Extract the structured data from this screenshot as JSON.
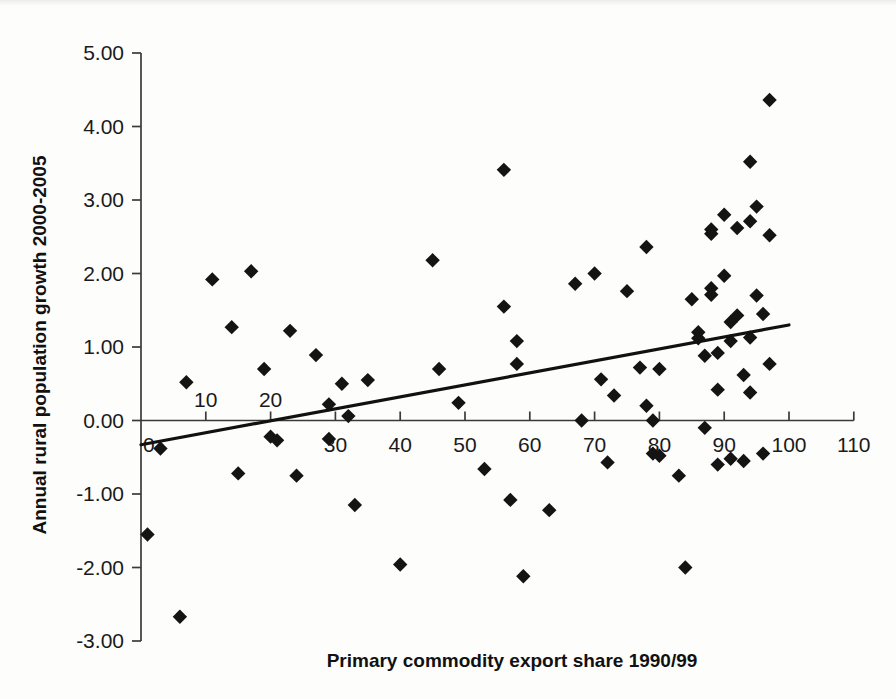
{
  "chart_data": {
    "type": "scatter",
    "title": "",
    "xlabel": "Primary commodity export share 1990/99",
    "ylabel": "Annual rural population growth 2000-2005",
    "xlim": [
      0,
      110
    ],
    "ylim": [
      -3.0,
      5.0
    ],
    "xticks": [
      0,
      10,
      20,
      30,
      40,
      50,
      60,
      70,
      80,
      90,
      100,
      110
    ],
    "xtick_labels": [
      "0",
      "10",
      "20",
      "30",
      "40",
      "50",
      "60",
      "70",
      "80",
      "90",
      "100",
      "110"
    ],
    "yticks": [
      -3.0,
      -2.0,
      -1.0,
      0.0,
      1.0,
      2.0,
      3.0,
      4.0,
      5.0
    ],
    "ytick_labels": [
      "-3.00",
      "-2.00",
      "-1.00",
      "0.00",
      "1.00",
      "2.00",
      "3.00",
      "4.00",
      "5.00"
    ],
    "grid": false,
    "legend": null,
    "marker": "diamond",
    "marker_color": "#141414",
    "axis_color": "#3a3a3a",
    "trendline": {
      "type": "linear",
      "color": "#111111",
      "x_start": 0,
      "y_start": -0.33,
      "x_end": 100,
      "y_end": 1.3,
      "slope": 0.0163,
      "intercept": -0.33
    },
    "points": [
      {
        "x": 1,
        "y": -1.55
      },
      {
        "x": 3,
        "y": -0.38
      },
      {
        "x": 6,
        "y": -2.67
      },
      {
        "x": 7,
        "y": 0.52
      },
      {
        "x": 11,
        "y": 1.92
      },
      {
        "x": 14,
        "y": 1.27
      },
      {
        "x": 15,
        "y": -0.72
      },
      {
        "x": 17,
        "y": 2.03
      },
      {
        "x": 19,
        "y": 0.7
      },
      {
        "x": 20,
        "y": -0.22
      },
      {
        "x": 21,
        "y": -0.27
      },
      {
        "x": 23,
        "y": 1.22
      },
      {
        "x": 24,
        "y": -0.75
      },
      {
        "x": 27,
        "y": 0.89
      },
      {
        "x": 29,
        "y": 0.22
      },
      {
        "x": 29,
        "y": -0.25
      },
      {
        "x": 31,
        "y": 0.5
      },
      {
        "x": 32,
        "y": 0.06
      },
      {
        "x": 33,
        "y": -1.15
      },
      {
        "x": 35,
        "y": 0.55
      },
      {
        "x": 40,
        "y": -1.96
      },
      {
        "x": 45,
        "y": 2.18
      },
      {
        "x": 46,
        "y": 0.7
      },
      {
        "x": 49,
        "y": 0.24
      },
      {
        "x": 53,
        "y": -0.66
      },
      {
        "x": 56,
        "y": 3.41
      },
      {
        "x": 56,
        "y": 1.55
      },
      {
        "x": 57,
        "y": -1.08
      },
      {
        "x": 58,
        "y": 1.08
      },
      {
        "x": 58,
        "y": 0.77
      },
      {
        "x": 59,
        "y": -2.12
      },
      {
        "x": 63,
        "y": -1.22
      },
      {
        "x": 67,
        "y": 1.86
      },
      {
        "x": 68,
        "y": 0.0
      },
      {
        "x": 70,
        "y": 2.0
      },
      {
        "x": 71,
        "y": 0.56
      },
      {
        "x": 72,
        "y": -0.57
      },
      {
        "x": 73,
        "y": 0.34
      },
      {
        "x": 75,
        "y": 1.76
      },
      {
        "x": 77,
        "y": 0.72
      },
      {
        "x": 78,
        "y": 2.36
      },
      {
        "x": 78,
        "y": 0.2
      },
      {
        "x": 79,
        "y": 0.0
      },
      {
        "x": 79,
        "y": -0.45
      },
      {
        "x": 80,
        "y": 0.7
      },
      {
        "x": 80,
        "y": -0.48
      },
      {
        "x": 83,
        "y": -0.75
      },
      {
        "x": 84,
        "y": -2.0
      },
      {
        "x": 85,
        "y": 1.65
      },
      {
        "x": 86,
        "y": 1.2
      },
      {
        "x": 86,
        "y": 1.12
      },
      {
        "x": 87,
        "y": 0.88
      },
      {
        "x": 87,
        "y": -0.1
      },
      {
        "x": 88,
        "y": 2.6
      },
      {
        "x": 88,
        "y": 2.54
      },
      {
        "x": 88,
        "y": 1.8
      },
      {
        "x": 88,
        "y": 1.71
      },
      {
        "x": 89,
        "y": 0.92
      },
      {
        "x": 89,
        "y": 0.42
      },
      {
        "x": 89,
        "y": -0.6
      },
      {
        "x": 90,
        "y": 2.8
      },
      {
        "x": 90,
        "y": 1.97
      },
      {
        "x": 91,
        "y": 1.34
      },
      {
        "x": 91,
        "y": 1.08
      },
      {
        "x": 91,
        "y": -0.52
      },
      {
        "x": 92,
        "y": 2.62
      },
      {
        "x": 92,
        "y": 1.43
      },
      {
        "x": 93,
        "y": 0.62
      },
      {
        "x": 93,
        "y": -0.55
      },
      {
        "x": 94,
        "y": 3.52
      },
      {
        "x": 94,
        "y": 2.71
      },
      {
        "x": 94,
        "y": 1.13
      },
      {
        "x": 94,
        "y": 0.38
      },
      {
        "x": 95,
        "y": 2.91
      },
      {
        "x": 95,
        "y": 1.7
      },
      {
        "x": 96,
        "y": 1.45
      },
      {
        "x": 96,
        "y": -0.45
      },
      {
        "x": 97,
        "y": 4.36
      },
      {
        "x": 97,
        "y": 2.52
      },
      {
        "x": 97,
        "y": 0.77
      }
    ]
  }
}
